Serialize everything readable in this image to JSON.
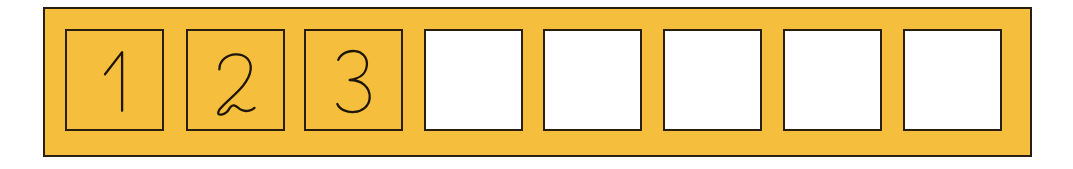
{
  "strip": {
    "background_color": "#F5BE3C",
    "border_color": "#2A1E10"
  },
  "cells": [
    {
      "index": 1,
      "value": "1",
      "filled": true,
      "fill": "#F5BE3C"
    },
    {
      "index": 2,
      "value": "2",
      "filled": true,
      "fill": "#F5BE3C"
    },
    {
      "index": 3,
      "value": "3",
      "filled": true,
      "fill": "#F5BE3C"
    },
    {
      "index": 4,
      "value": "",
      "filled": false,
      "fill": "#FFFFFF"
    },
    {
      "index": 5,
      "value": "",
      "filled": false,
      "fill": "#FFFFFF"
    },
    {
      "index": 6,
      "value": "",
      "filled": false,
      "fill": "#FFFFFF"
    },
    {
      "index": 7,
      "value": "",
      "filled": false,
      "fill": "#FFFFFF"
    },
    {
      "index": 8,
      "value": "",
      "filled": false,
      "fill": "#FFFFFF"
    }
  ]
}
